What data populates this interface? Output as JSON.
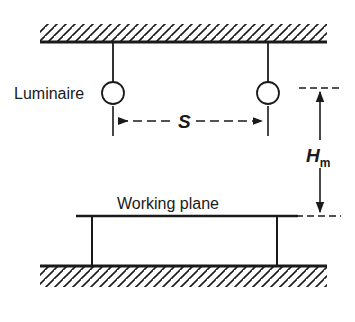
{
  "diagram": {
    "type": "technical-line-diagram",
    "background_color": "#ffffff",
    "line_color": "#1a1a1a",
    "labels": {
      "luminaire": "Luminaire",
      "spacing_symbol": "S",
      "mounting_height_symbol": "H",
      "mounting_height_subscript": "m",
      "working_plane": "Working plane"
    },
    "elements": {
      "ceiling": {
        "name": "ceiling",
        "hatched": true,
        "hatch_direction": "up-right",
        "line_y": 42,
        "x_start": 40,
        "x_end": 327
      },
      "floor": {
        "name": "floor",
        "hatched": true,
        "hatch_direction": "up-right",
        "line_y": 266,
        "x_start": 40,
        "x_end": 327
      },
      "working_plane": {
        "name": "working-plane",
        "line_y": 216,
        "x_start": 76,
        "x_end": 298,
        "leg_left_x": 92,
        "leg_right_x": 277
      },
      "luminaires": [
        {
          "name": "luminaire-left",
          "cx": 113,
          "cy": 93,
          "r": 11,
          "rod_top_y": 42
        },
        {
          "name": "luminaire-right",
          "cx": 268,
          "cy": 93,
          "r": 11,
          "rod_top_y": 42
        }
      ],
      "spacing_dimension": {
        "name": "spacing-dimension",
        "y": 121,
        "x_start": 113,
        "x_end": 268,
        "style": "dashed-with-arrows-both-ends"
      },
      "mounting_height_dimension": {
        "name": "mounting-height-dimension",
        "x": 320,
        "y_top": 88,
        "y_bottom": 216,
        "style": "solid-with-arrows-both-ends"
      }
    }
  }
}
